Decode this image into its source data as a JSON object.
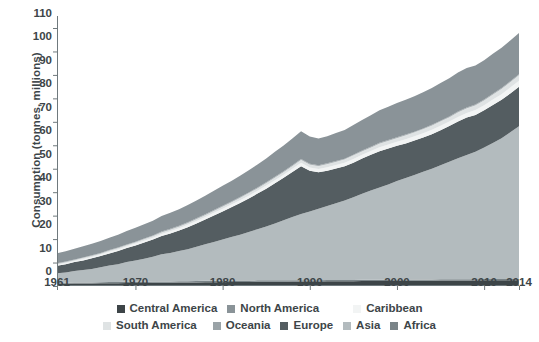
{
  "chart_data": {
    "type": "area",
    "stacked": true,
    "title": "",
    "xlabel": "",
    "ylabel": "Consumption (tonnes, millions)",
    "xlim": [
      1961,
      2014
    ],
    "ylim": [
      0,
      110
    ],
    "yticks": [
      0,
      10,
      20,
      30,
      40,
      50,
      60,
      70,
      80,
      90,
      100,
      110
    ],
    "xticks": [
      1961,
      1970,
      1980,
      1990,
      2000,
      2010,
      2014
    ],
    "xtick_labels": [
      "1961",
      "1970",
      "1980",
      "1990",
      "2000",
      "2010",
      "2014"
    ],
    "grid": false,
    "legend_position": "bottom",
    "x": [
      1961,
      1962,
      1963,
      1964,
      1965,
      1966,
      1967,
      1968,
      1969,
      1970,
      1971,
      1972,
      1973,
      1974,
      1975,
      1976,
      1977,
      1978,
      1979,
      1980,
      1981,
      1982,
      1983,
      1984,
      1985,
      1986,
      1987,
      1988,
      1989,
      1990,
      1991,
      1992,
      1993,
      1994,
      1995,
      1996,
      1997,
      1998,
      1999,
      2000,
      2001,
      2002,
      2003,
      2004,
      2005,
      2006,
      2007,
      2008,
      2009,
      2010,
      2011,
      2012,
      2013,
      2014
    ],
    "series": [
      {
        "name": "Central America",
        "color": "#3d4548",
        "values": [
          1.0,
          1.0,
          1.1,
          1.1,
          1.1,
          1.2,
          1.2,
          1.2,
          1.3,
          1.3,
          1.3,
          1.4,
          1.4,
          1.4,
          1.5,
          1.5,
          1.5,
          1.6,
          1.6,
          1.6,
          1.7,
          1.7,
          1.7,
          1.8,
          1.8,
          1.8,
          1.8,
          1.9,
          1.9,
          1.9,
          1.9,
          2.0,
          2.0,
          2.0,
          2.0,
          2.1,
          2.1,
          2.1,
          2.1,
          2.2,
          2.2,
          2.2,
          2.2,
          2.2,
          2.3,
          2.3,
          2.3,
          2.3,
          2.3,
          2.4,
          2.4,
          2.4,
          2.4,
          2.5
        ]
      },
      {
        "name": "Africa",
        "color": "#7a8488",
        "values": [
          0.4,
          0.4,
          0.4,
          0.4,
          0.4,
          0.4,
          0.5,
          0.5,
          0.5,
          0.5,
          0.5,
          0.5,
          0.5,
          0.5,
          0.5,
          0.5,
          0.6,
          0.6,
          0.6,
          0.6,
          0.6,
          0.6,
          0.6,
          0.6,
          0.6,
          0.6,
          0.6,
          0.6,
          0.6,
          0.6,
          0.6,
          0.6,
          0.6,
          0.6,
          0.6,
          0.6,
          0.6,
          0.6,
          0.6,
          0.6,
          0.6,
          0.6,
          0.6,
          0.6,
          0.6,
          0.6,
          0.6,
          0.6,
          0.6,
          0.6,
          0.6,
          0.6,
          0.6,
          0.6
        ]
      },
      {
        "name": "Asia",
        "color": "#b3bbbe",
        "values": [
          4.0,
          4.4,
          4.9,
          5.3,
          5.8,
          6.4,
          7.0,
          7.6,
          8.4,
          9.1,
          9.8,
          10.6,
          11.6,
          12.2,
          12.9,
          13.7,
          14.6,
          15.6,
          16.6,
          17.6,
          18.6,
          19.6,
          20.7,
          21.8,
          23.0,
          24.3,
          25.6,
          26.9,
          28.2,
          29.3,
          30.4,
          31.5,
          32.7,
          33.9,
          35.2,
          36.6,
          38.0,
          39.3,
          40.6,
          42.0,
          43.2,
          44.5,
          45.9,
          47.2,
          48.6,
          50.1,
          51.6,
          53.0,
          54.3,
          56.0,
          58.0,
          60.0,
          62.5,
          65.0
        ]
      },
      {
        "name": "Europe",
        "color": "#545d61",
        "values": [
          3.2,
          3.5,
          3.8,
          4.1,
          4.5,
          4.8,
          5.2,
          5.6,
          6.0,
          6.4,
          6.9,
          7.3,
          7.8,
          8.3,
          8.8,
          9.4,
          10.0,
          10.6,
          11.3,
          12.0,
          12.7,
          13.5,
          14.3,
          15.2,
          16.1,
          17.1,
          18.1,
          19.2,
          20.4,
          17.3,
          15.6,
          15.0,
          14.8,
          14.6,
          14.8,
          15.1,
          15.3,
          15.5,
          15.3,
          15.0,
          14.8,
          14.7,
          14.6,
          14.7,
          14.9,
          15.2,
          15.6,
          15.9,
          15.7,
          15.9,
          16.2,
          16.4,
          16.6,
          16.8
        ]
      },
      {
        "name": "Caribbean",
        "color": "#f2f4f4",
        "values": [
          0.5,
          0.5,
          0.5,
          0.6,
          0.6,
          0.6,
          0.7,
          0.7,
          0.7,
          0.8,
          0.8,
          0.8,
          0.9,
          0.9,
          0.9,
          1.0,
          1.0,
          1.0,
          1.1,
          1.1,
          1.1,
          1.2,
          1.2,
          1.2,
          1.3,
          1.3,
          1.3,
          1.4,
          1.4,
          1.4,
          1.4,
          1.5,
          1.5,
          1.5,
          1.6,
          1.6,
          1.6,
          1.7,
          1.7,
          1.7,
          1.8,
          1.8,
          1.8,
          1.9,
          1.9,
          1.9,
          2.0,
          2.0,
          2.1,
          2.2,
          2.3,
          2.4,
          2.5,
          2.6
        ]
      },
      {
        "name": "South America",
        "color": "#dfe3e4",
        "values": [
          0.4,
          0.4,
          0.4,
          0.5,
          0.5,
          0.5,
          0.5,
          0.6,
          0.6,
          0.6,
          0.7,
          0.7,
          0.7,
          0.8,
          0.8,
          0.8,
          0.9,
          0.9,
          0.9,
          1.0,
          1.0,
          1.0,
          1.1,
          1.1,
          1.1,
          1.2,
          1.2,
          1.2,
          1.3,
          1.3,
          1.3,
          1.4,
          1.4,
          1.4,
          1.5,
          1.5,
          1.5,
          1.6,
          1.6,
          1.6,
          1.7,
          1.7,
          1.8,
          1.8,
          1.9,
          1.9,
          2.0,
          2.0,
          2.1,
          2.1,
          2.2,
          2.3,
          2.4,
          2.5
        ]
      },
      {
        "name": "Oceania",
        "color": "#9aa3a7",
        "values": [
          0.2,
          0.2,
          0.2,
          0.2,
          0.2,
          0.2,
          0.2,
          0.2,
          0.2,
          0.2,
          0.2,
          0.2,
          0.3,
          0.3,
          0.3,
          0.3,
          0.3,
          0.3,
          0.3,
          0.3,
          0.3,
          0.3,
          0.3,
          0.3,
          0.3,
          0.3,
          0.3,
          0.3,
          0.3,
          0.3,
          0.3,
          0.3,
          0.3,
          0.3,
          0.3,
          0.3,
          0.3,
          0.3,
          0.3,
          0.3,
          0.3,
          0.3,
          0.3,
          0.3,
          0.3,
          0.3,
          0.3,
          0.3,
          0.3,
          0.3,
          0.3,
          0.3,
          0.3,
          0.3
        ]
      },
      {
        "name": "North America",
        "color": "#8a9398",
        "values": [
          4.3,
          4.4,
          4.6,
          4.7,
          4.9,
          5.1,
          5.3,
          5.5,
          5.7,
          5.9,
          6.1,
          6.3,
          6.6,
          6.8,
          7.0,
          7.3,
          7.6,
          7.9,
          8.2,
          8.5,
          8.8,
          9.1,
          9.5,
          9.8,
          10.2,
          10.6,
          11.0,
          11.4,
          11.9,
          11.6,
          11.4,
          11.6,
          11.9,
          12.2,
          12.6,
          13.0,
          13.4,
          13.8,
          14.2,
          14.6,
          14.8,
          15.1,
          15.4,
          15.7,
          16.0,
          16.3,
          16.6,
          16.8,
          16.6,
          16.8,
          17.0,
          17.2,
          17.4,
          17.6
        ]
      }
    ],
    "totals": [
      14.0,
      14.8,
      15.9,
      16.9,
      18.0,
      19.2,
      20.6,
      21.9,
      23.4,
      24.8,
      26.3,
      27.8,
      29.8,
      31.2,
      32.7,
      34.5,
      36.5,
      38.5,
      40.6,
      42.7,
      44.8,
      47.0,
      49.4,
      51.8,
      54.4,
      57.2,
      59.9,
      62.9,
      66.0,
      63.7,
      62.9,
      63.9,
      65.2,
      66.5,
      68.6,
      70.8,
      72.8,
      74.9,
      76.4,
      77.9,
      79.4,
      80.9,
      82.6,
      84.4,
      86.5,
      88.6,
      90.9,
      92.9,
      94.0,
      96.3,
      99.0,
      101.6,
      104.7,
      107.8
    ]
  },
  "axis": {
    "ylabel": "Consumption (tonnes, millions)",
    "ytick_labels": [
      "110",
      "100",
      "90",
      "80",
      "70",
      "60",
      "50",
      "40",
      "30",
      "20",
      "10",
      "0"
    ],
    "xtick_labels": [
      "1961",
      "1970",
      "1980",
      "1990",
      "2000",
      "2010",
      "2014"
    ]
  },
  "legend": {
    "row1": [
      {
        "label": "Central America",
        "color": "#3d4548"
      },
      {
        "label": "North America",
        "color": "#8a9398"
      },
      {
        "label": "Caribbean",
        "color": "#f2f4f4"
      }
    ],
    "row2": [
      {
        "label": "South America",
        "color": "#dfe3e4"
      },
      {
        "label": "Oceania",
        "color": "#9aa3a7"
      },
      {
        "label": "Europe",
        "color": "#545d61"
      },
      {
        "label": "Asia",
        "color": "#b3bbbe"
      },
      {
        "label": "Africa",
        "color": "#7a8488"
      }
    ]
  },
  "colors": {
    "axis": "#3d4548",
    "text": "#3d4548",
    "background": "#ffffff"
  }
}
